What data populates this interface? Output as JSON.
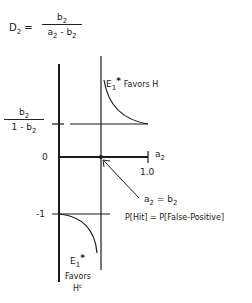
{
  "equation": {
    "lhs_var": "D",
    "lhs_sub": "2",
    "equals": "=",
    "numerator_var": "b",
    "numerator_sub": "2",
    "denominator_a": "a",
    "denominator_a_sub": "2",
    "denominator_minus": " - ",
    "denominator_b": "b",
    "denominator_b_sub": "2"
  },
  "y_axis_labels": {
    "upper_fraction_num_var": "b",
    "upper_fraction_num_sub": "2",
    "upper_fraction_den_prefix": "1 - b",
    "upper_fraction_den_sub": "2",
    "zero": "0",
    "minus_one": "-1"
  },
  "x_axis": {
    "var": "a",
    "sub": "2",
    "tick_label": "1.0"
  },
  "annotations": {
    "upper_curve_e": "E",
    "upper_curve_e_sub": "1",
    "upper_curve_star": "*",
    "upper_curve_text": "Favors H",
    "lower_curve_e": "E",
    "lower_curve_e_sub": "1",
    "lower_curve_star": "*",
    "lower_curve_favors": "Favors",
    "lower_curve_h": "H",
    "lower_curve_h_sup": "c",
    "condition_a": "a",
    "condition_a_sub": "2",
    "condition_eq": " = b",
    "condition_b_sub": "2",
    "condition_text": "P[Hit] = P[False-Positive]"
  },
  "colors": {
    "ink": "#1a1a1a",
    "background": "#ffffff"
  }
}
